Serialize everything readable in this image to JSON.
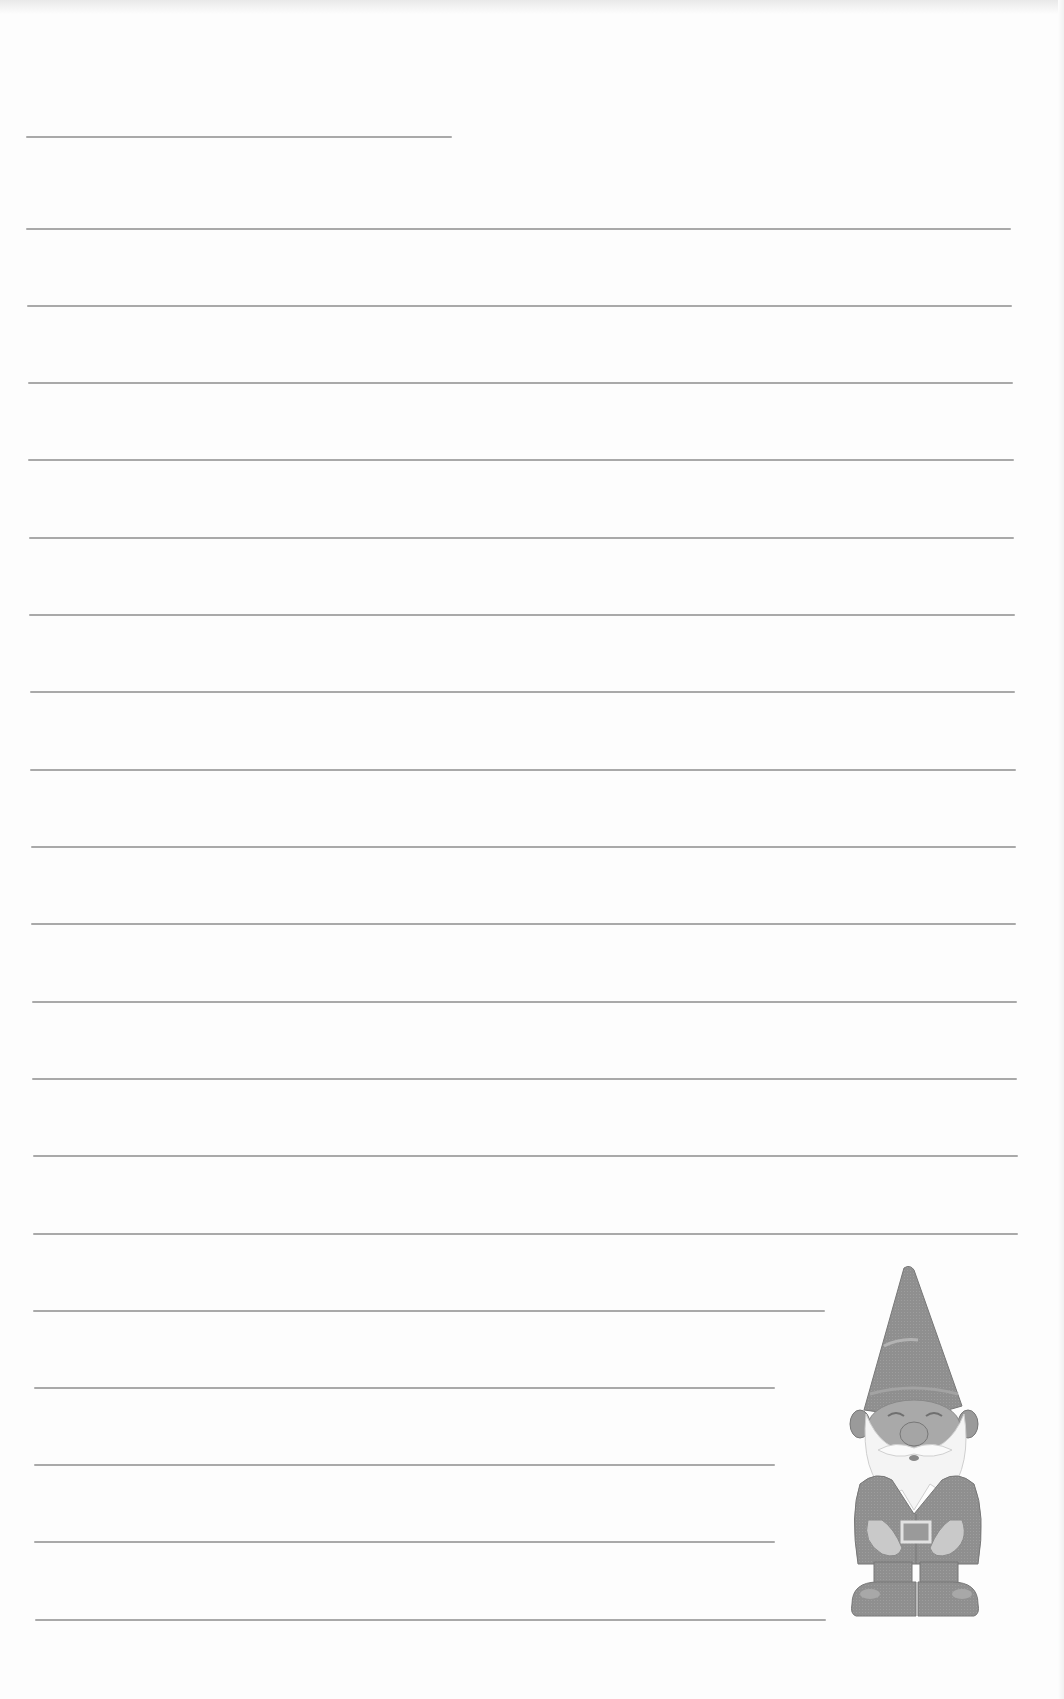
{
  "page": {
    "type": "lined-stationery",
    "background": "#fdfdfd",
    "rule_color": "#a9a9a9"
  },
  "name_line": {
    "x": 26,
    "y": 136,
    "width": 426
  },
  "rules": [
    {
      "x": 26,
      "y": 228,
      "width": 985
    },
    {
      "x": 27,
      "y": 305,
      "width": 985
    },
    {
      "x": 28,
      "y": 382,
      "width": 985
    },
    {
      "x": 28,
      "y": 459,
      "width": 986
    },
    {
      "x": 29,
      "y": 537,
      "width": 985
    },
    {
      "x": 29,
      "y": 614,
      "width": 986
    },
    {
      "x": 30,
      "y": 691,
      "width": 985
    },
    {
      "x": 30,
      "y": 769,
      "width": 986
    },
    {
      "x": 31,
      "y": 846,
      "width": 985
    },
    {
      "x": 31,
      "y": 923,
      "width": 985
    },
    {
      "x": 32,
      "y": 1001,
      "width": 985
    },
    {
      "x": 32,
      "y": 1078,
      "width": 985
    },
    {
      "x": 33,
      "y": 1155,
      "width": 985
    },
    {
      "x": 33,
      "y": 1233,
      "width": 985
    },
    {
      "x": 33,
      "y": 1310,
      "width": 792
    },
    {
      "x": 34,
      "y": 1387,
      "width": 741
    },
    {
      "x": 34,
      "y": 1464,
      "width": 741
    },
    {
      "x": 34,
      "y": 1541,
      "width": 741
    },
    {
      "x": 35,
      "y": 1619,
      "width": 791
    }
  ],
  "illustration": {
    "name": "garden-gnome",
    "description": "Garden gnome with pointed hat, white beard, belt buckle, hands on belly"
  }
}
